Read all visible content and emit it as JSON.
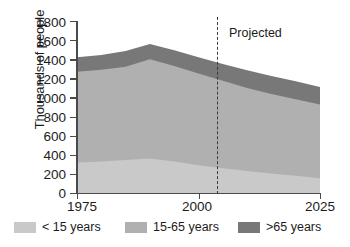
{
  "chart_data": {
    "type": "area",
    "title": "",
    "subtitle": "",
    "xlabel": "",
    "ylabel": "Thousands of people",
    "stacked": true,
    "xlim": [
      1975,
      2025
    ],
    "ylim": [
      0,
      1800
    ],
    "ytick_values": [
      0,
      200,
      400,
      600,
      800,
      1000,
      1200,
      1400,
      1600,
      1800
    ],
    "ytick_labels": [
      "0",
      "200",
      "400",
      "600",
      "800",
      "1000",
      "1200",
      "1400",
      "1600",
      "1800"
    ],
    "xtick_values": [
      1975,
      2000,
      2025
    ],
    "xtick_labels": [
      "1975",
      "2000",
      "2025"
    ],
    "grid": false,
    "legend_position": "bottom",
    "x": [
      1975,
      1980,
      1985,
      1990,
      1995,
      2000,
      2005,
      2010,
      2015,
      2020,
      2025
    ],
    "series": [
      {
        "name": "< 15 years",
        "color": "#c9c9c9",
        "values": [
          320,
          330,
          345,
          360,
          330,
          290,
          260,
          230,
          205,
          180,
          155
        ]
      },
      {
        "name": "15-65 years",
        "color": "#b0b0b0",
        "values": [
          950,
          960,
          975,
          1040,
          1000,
          960,
          915,
          870,
          830,
          800,
          770
        ]
      },
      {
        "name": ">65 years",
        "color": "#787878",
        "values": [
          150,
          155,
          165,
          160,
          165,
          170,
          175,
          185,
          190,
          190,
          185
        ]
      }
    ],
    "stack_tops": {
      "lower": [
        320,
        330,
        345,
        360,
        330,
        290,
        260,
        230,
        205,
        180,
        155
      ],
      "middle": [
        1270,
        1290,
        1320,
        1400,
        1330,
        1250,
        1175,
        1100,
        1035,
        980,
        925
      ],
      "upper": [
        1420,
        1445,
        1485,
        1560,
        1495,
        1420,
        1350,
        1285,
        1225,
        1170,
        1110
      ]
    },
    "annotations": [
      {
        "name": "projected-divider",
        "label": "Projected",
        "x": 2006,
        "style": "dashed-vertical-line"
      }
    ],
    "legend": [
      {
        "label": "< 15 years",
        "color": "#c9c9c9"
      },
      {
        "label": "15-65 years",
        "color": "#b0b0b0"
      },
      {
        "label": ">65 years",
        "color": "#787878"
      }
    ]
  }
}
